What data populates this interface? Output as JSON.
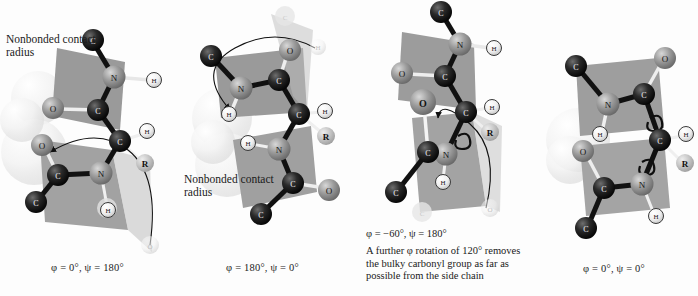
{
  "figure": {
    "type": "molecular-conformation-diagram",
    "background_color": "#fdfdfd",
    "panel_count": 4
  },
  "colors": {
    "peptide_plane": "#9a9a9a",
    "peptide_plane_light": "#b5b5b5",
    "carbon_alpha": "#141414",
    "carbon": "#1c1c1c",
    "nitrogen": "#8f8f8f",
    "oxygen": "#9d9d9d",
    "hydrogen": "#ffffff",
    "r_group": "#bdbdbd",
    "contact_sphere": "#e8e8e8",
    "ghost_atom": "#ededed",
    "bond_dark": "#111111",
    "bond_light": "#f2f2f2",
    "text": "#1a1a1a"
  },
  "atom_labels": {
    "c_alpha": "C",
    "c_alpha_sub": "α",
    "carbon": "C",
    "nitrogen": "N",
    "oxygen": "O",
    "hydrogen": "H",
    "side_chain": "R"
  },
  "panels": [
    {
      "id": "panel-1",
      "note": "Nonbonded contact radius",
      "caption": "φ = 0°, ψ = 180°",
      "phi": "0°",
      "psi": "180°",
      "has_contact_spheres": true,
      "has_rotation_arrow": true,
      "has_ghost_atoms": true,
      "rotation_target": "O"
    },
    {
      "id": "panel-2",
      "note": "Nonbonded contact radius",
      "caption": "φ = 180°, ψ = 0°",
      "phi": "180°",
      "psi": "0°",
      "has_contact_spheres": true,
      "has_rotation_arrow": true,
      "has_ghost_atoms": true,
      "rotation_target": "H"
    },
    {
      "id": "panel-3",
      "note": "",
      "caption_angle": "φ = −60°, ψ = 180°",
      "caption_text": "A further φ rotation of 120° removes the bulky carbonyl group as far as possible from the side chain",
      "phi": "−60°",
      "psi": "180°",
      "has_contact_spheres": false,
      "has_rotation_arrow": true,
      "has_ghost_atoms": true,
      "rotation_target": "O"
    },
    {
      "id": "panel-4",
      "note": "",
      "caption": "φ = 0°, ψ = 0°",
      "phi": "0°",
      "psi": "0°",
      "has_contact_spheres": true,
      "has_rotation_arrow": false,
      "has_ghost_atoms": false,
      "rotation_target": ""
    }
  ]
}
